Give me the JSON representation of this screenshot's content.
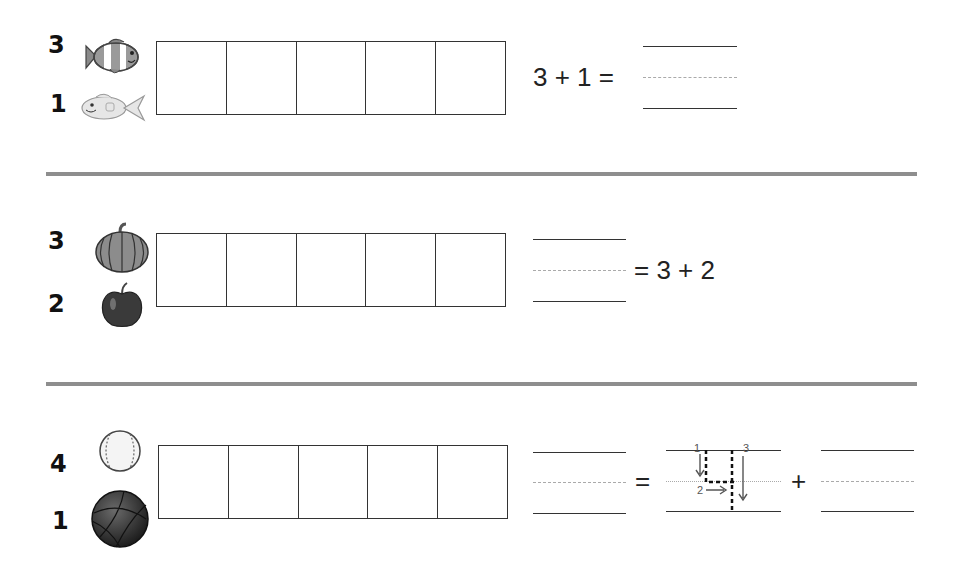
{
  "worksheet": {
    "problems": [
      {
        "top": {
          "count": "3",
          "icon": "clownfish-icon"
        },
        "bottom": {
          "count": "1",
          "icon": "fish-icon"
        },
        "frame_cells": 5,
        "equation": {
          "left": "3 + 1 =",
          "right": ""
        }
      },
      {
        "top": {
          "count": "3",
          "icon": "pumpkin-icon"
        },
        "bottom": {
          "count": "2",
          "icon": "apple-icon"
        },
        "frame_cells": 5,
        "equation": {
          "left": "",
          "right": "= 3 + 2"
        }
      },
      {
        "top": {
          "count": "4",
          "icon": "baseball-icon"
        },
        "bottom": {
          "count": "1",
          "icon": "basketball-icon"
        },
        "frame_cells": 5,
        "equation": {
          "equals": "=",
          "plus": "+",
          "traced_digit": "4",
          "stroke_labels": [
            "1",
            "2",
            "3"
          ]
        }
      }
    ]
  },
  "colors": {
    "ink": "#222222",
    "divider": "#8e8e8e",
    "guide_dash": "#aaaaaa"
  }
}
